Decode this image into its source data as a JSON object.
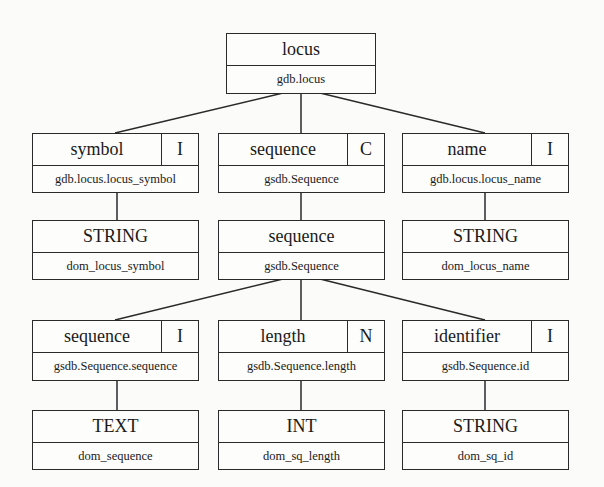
{
  "diagram": {
    "type": "schema-mapping-tree",
    "nodes": {
      "root": {
        "title": "locus",
        "kind": "",
        "source": "gdb.locus"
      },
      "symbol": {
        "title": "symbol",
        "kind": "I",
        "source": "gdb.locus.locus_symbol"
      },
      "sequence_c": {
        "title": "sequence",
        "kind": "C",
        "source": "gsdb.Sequence"
      },
      "name": {
        "title": "name",
        "kind": "I",
        "source": "gdb.locus.locus_name"
      },
      "symbol_dom": {
        "title": "STRING",
        "kind": "",
        "source": "dom_locus_symbol"
      },
      "sequence_cls": {
        "title": "sequence",
        "kind": "",
        "source": "gsdb.Sequence"
      },
      "name_dom": {
        "title": "STRING",
        "kind": "",
        "source": "dom_locus_name"
      },
      "seq_seq": {
        "title": "sequence",
        "kind": "I",
        "source": "gsdb.Sequence.sequence"
      },
      "seq_len": {
        "title": "length",
        "kind": "N",
        "source": "gsdb.Sequence.length"
      },
      "seq_id": {
        "title": "identifier",
        "kind": "I",
        "source": "gsdb.Sequence.id"
      },
      "seq_seq_dom": {
        "title": "TEXT",
        "kind": "",
        "source": "dom_sequence"
      },
      "seq_len_dom": {
        "title": "INT",
        "kind": "",
        "source": "dom_sq_length"
      },
      "seq_id_dom": {
        "title": "STRING",
        "kind": "",
        "source": "dom_sq_id"
      }
    },
    "edges": [
      [
        "root",
        "symbol"
      ],
      [
        "root",
        "sequence_c"
      ],
      [
        "root",
        "name"
      ],
      [
        "symbol",
        "symbol_dom"
      ],
      [
        "sequence_c",
        "sequence_cls"
      ],
      [
        "name",
        "name_dom"
      ],
      [
        "sequence_cls",
        "seq_seq"
      ],
      [
        "sequence_cls",
        "seq_len"
      ],
      [
        "sequence_cls",
        "seq_id"
      ],
      [
        "seq_seq",
        "seq_seq_dom"
      ],
      [
        "seq_len",
        "seq_len_dom"
      ],
      [
        "seq_id",
        "seq_id_dom"
      ]
    ],
    "colors": {
      "line": "#2a2a2a",
      "background": "#fbfbf9",
      "text": "#1a1a1a"
    }
  }
}
